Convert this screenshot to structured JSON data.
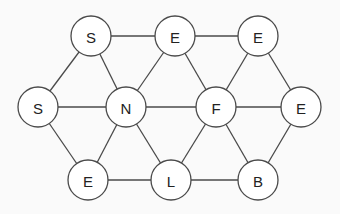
{
  "diagram": {
    "type": "triangular-lattice-letter-graph",
    "background": "#fafafa",
    "stroke_color": "#4a4a4a",
    "node_fill": "#ffffff",
    "node_radius": 20,
    "nodes": [
      {
        "id": "n0",
        "label": "S",
        "x": 91,
        "y": 36
      },
      {
        "id": "n1",
        "label": "E",
        "x": 175,
        "y": 36
      },
      {
        "id": "n2",
        "label": "E",
        "x": 258,
        "y": 36
      },
      {
        "id": "n3",
        "label": "S",
        "x": 38,
        "y": 107
      },
      {
        "id": "n4",
        "label": "N",
        "x": 126,
        "y": 107
      },
      {
        "id": "n5",
        "label": "F",
        "x": 216,
        "y": 107
      },
      {
        "id": "n6",
        "label": "E",
        "x": 301,
        "y": 107
      },
      {
        "id": "n7",
        "label": "E",
        "x": 88,
        "y": 180
      },
      {
        "id": "n8",
        "label": "L",
        "x": 171,
        "y": 180
      },
      {
        "id": "n9",
        "label": "B",
        "x": 258,
        "y": 180
      }
    ],
    "edges": [
      [
        "n0",
        "n1"
      ],
      [
        "n1",
        "n2"
      ],
      [
        "n0",
        "n3"
      ],
      [
        "n0",
        "n4"
      ],
      [
        "n1",
        "n4"
      ],
      [
        "n1",
        "n5"
      ],
      [
        "n2",
        "n5"
      ],
      [
        "n2",
        "n6"
      ],
      [
        "n3",
        "n4"
      ],
      [
        "n4",
        "n5"
      ],
      [
        "n5",
        "n6"
      ],
      [
        "n3",
        "n7"
      ],
      [
        "n4",
        "n7"
      ],
      [
        "n4",
        "n8"
      ],
      [
        "n5",
        "n8"
      ],
      [
        "n5",
        "n9"
      ],
      [
        "n6",
        "n9"
      ],
      [
        "n7",
        "n8"
      ],
      [
        "n8",
        "n9"
      ]
    ]
  }
}
